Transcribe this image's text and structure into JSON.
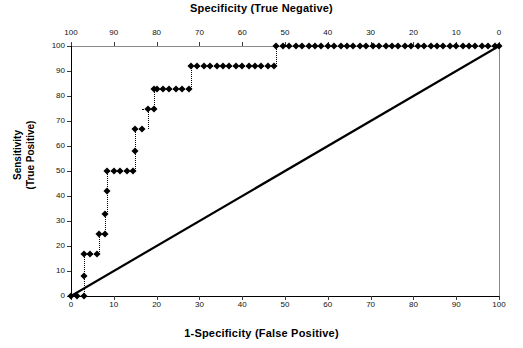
{
  "titles": {
    "top": "Specificity (True Negative)",
    "bottom": "1-Specificity (False Positive)",
    "left_line1": "Sensitivity",
    "left_line2": "(True Positive)"
  },
  "axes": {
    "bottom_ticks": [
      "0",
      "10",
      "20",
      "30",
      "40",
      "50",
      "60",
      "70",
      "80",
      "90",
      "100"
    ],
    "top_ticks": [
      "100",
      "90",
      "80",
      "70",
      "60",
      "50",
      "40",
      "30",
      "20",
      "10",
      "0"
    ],
    "left_ticks": [
      "0",
      "10",
      "20",
      "30",
      "40",
      "50",
      "60",
      "70",
      "80",
      "90",
      "100"
    ],
    "x_min": 0,
    "x_max": 100,
    "y_min": 0,
    "y_max": 100
  },
  "chart_data": {
    "type": "scatter",
    "title": "Specificity (True Negative)",
    "xlabel": "1-Specificity (False Positive)",
    "ylabel": "Sensitivity (True Positive)",
    "xlim": [
      0,
      100
    ],
    "ylim": [
      0,
      100
    ],
    "grid": false,
    "legend": "none",
    "secondary_x_axis": {
      "label": "Specificity (True Negative)",
      "ticks": [
        100,
        90,
        80,
        70,
        60,
        50,
        40,
        30,
        20,
        10,
        0
      ],
      "direction": "reversed"
    },
    "series": [
      {
        "name": "ROC curve",
        "marker": "diamond",
        "connector": "dotted",
        "x": [
          0,
          1.5,
          3,
          3,
          3,
          4.5,
          6,
          6.5,
          8,
          8,
          8.5,
          8.5,
          10,
          11.5,
          13,
          14.5,
          15,
          15,
          16.5,
          18,
          19.5,
          19.5,
          20,
          21.5,
          23,
          24.5,
          26,
          27.5,
          28,
          29.5,
          31,
          32.5,
          34,
          35.5,
          37,
          38.5,
          40,
          41.5,
          43,
          44.5,
          46,
          47.5,
          48,
          49.5,
          51,
          52.5,
          54,
          55.5,
          57,
          58.5,
          60,
          61.5,
          63,
          64.5,
          66,
          67.5,
          69,
          70.5,
          72,
          73.5,
          75,
          76.5,
          78,
          79.5,
          81,
          82.5,
          84,
          85.5,
          87,
          88.5,
          90,
          91.5,
          93,
          94.5,
          96,
          97.5,
          99,
          100
        ],
        "y": [
          0,
          0,
          0,
          8,
          17,
          17,
          17,
          25,
          25,
          33,
          42,
          50,
          50,
          50,
          50,
          50,
          58,
          67,
          67,
          75,
          75,
          83,
          83,
          83,
          83,
          83,
          83,
          83,
          92,
          92,
          92,
          92,
          92,
          92,
          92,
          92,
          92,
          92,
          92,
          92,
          92,
          92,
          100,
          100,
          100,
          100,
          100,
          100,
          100,
          100,
          100,
          100,
          100,
          100,
          100,
          100,
          100,
          100,
          100,
          100,
          100,
          100,
          100,
          100,
          100,
          100,
          100,
          100,
          100,
          100,
          100,
          100,
          100,
          100,
          100,
          100,
          100,
          100
        ]
      },
      {
        "name": "reference diagonal",
        "style": "solid-line",
        "x": [
          0,
          100
        ],
        "y": [
          0,
          100
        ]
      }
    ],
    "plateau_levels": [
      0,
      8,
      17,
      25,
      33,
      42,
      50,
      58,
      67,
      75,
      83,
      92,
      100
    ]
  }
}
